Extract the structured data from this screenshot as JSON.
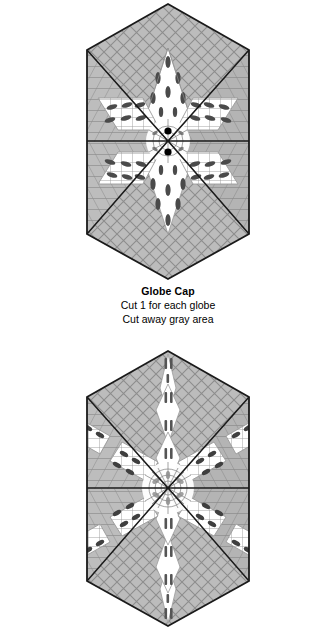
{
  "document": {
    "background_color": "#ffffff",
    "width": 336,
    "height": 639,
    "kind": "sewing-pattern-template-sheet"
  },
  "palette": {
    "gray_fill": "#b8b8b8",
    "gray_fill_light": "#c6c6c6",
    "gray_fill_dark": "#a9a9a9",
    "grid_line": "#8a8a8a",
    "outline": "#1a1a1a",
    "white": "#ffffff",
    "accent_dark": "#3d3d3d",
    "accent_black": "#000000"
  },
  "figures": [
    {
      "id": "globe-cap",
      "shape": "hexagon",
      "wedges": 6,
      "motif": "six-pointed-star",
      "star_points": 6,
      "center_dots": 2,
      "caption": {
        "title": "Globe Cap",
        "lines": [
          "Cut 1 for each globe",
          "Cut away gray area"
        ]
      }
    },
    {
      "id": "globe-top-bottom-half",
      "shape": "hexagon",
      "wedges": 6,
      "motif": "six-pointed-snowflake",
      "star_points": 6,
      "center_dots": 0,
      "caption": {
        "title": "Globe Top Half & Bottom Half",
        "lines": []
      }
    }
  ]
}
